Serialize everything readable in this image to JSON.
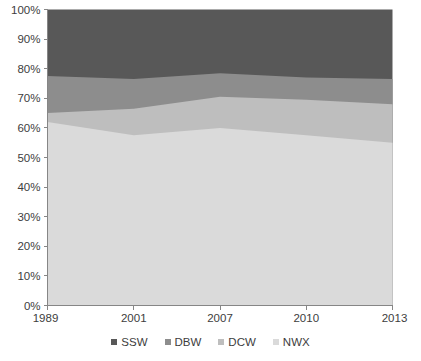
{
  "chart_data": {
    "type": "area",
    "stacked": true,
    "stack_mode": "percent",
    "title": "",
    "subtitle": "",
    "xlabel": "",
    "ylabel": "",
    "x": [
      "1989",
      "2001",
      "2007",
      "2010",
      "2013"
    ],
    "categories": [
      "1989",
      "2001",
      "2007",
      "2010",
      "2013"
    ],
    "xtick_labels": [
      "1989",
      "2001",
      "2007",
      "2010",
      "2013"
    ],
    "ytick_labels": [
      "0%",
      "10%",
      "20%",
      "30%",
      "40%",
      "50%",
      "60%",
      "70%",
      "80%",
      "90%",
      "100%"
    ],
    "ytick_values": [
      0,
      10,
      20,
      30,
      40,
      50,
      60,
      70,
      80,
      90,
      100
    ],
    "ylim": [
      0,
      100
    ],
    "grid": false,
    "legend_position": "bottom",
    "series_order_bottom_to_top": [
      "NWX",
      "DCW",
      "DBW",
      "SSW"
    ],
    "series": [
      {
        "name": "SSW",
        "color": "#585858",
        "values": [
          22.5,
          23.5,
          21.5,
          23.0,
          23.5
        ],
        "cumulative_top": [
          100,
          100,
          100,
          100,
          100
        ]
      },
      {
        "name": "DBW",
        "color": "#8d8d8d",
        "values": [
          12.5,
          10.0,
          8.0,
          7.5,
          8.5
        ],
        "cumulative_top": [
          77.5,
          76.5,
          78.5,
          77.0,
          76.5
        ]
      },
      {
        "name": "DCW",
        "color": "#bebebe",
        "values": [
          3.0,
          9.0,
          10.5,
          12.0,
          13.0
        ],
        "cumulative_top": [
          65.0,
          66.5,
          70.5,
          69.5,
          68.0
        ]
      },
      {
        "name": "NWX",
        "color": "#dadada",
        "values": [
          62.0,
          57.5,
          60.0,
          57.5,
          55.0
        ],
        "cumulative_top": [
          62.0,
          57.5,
          60.0,
          57.5,
          55.0
        ]
      }
    ]
  },
  "legend": {
    "items": [
      {
        "label": "SSW",
        "color": "#585858"
      },
      {
        "label": "DBW",
        "color": "#8d8d8d"
      },
      {
        "label": "DCW",
        "color": "#bebebe"
      },
      {
        "label": "NWX",
        "color": "#dadada"
      }
    ]
  },
  "axis": {
    "y_labels": [
      "100%",
      "90%",
      "80%",
      "70%",
      "60%",
      "50%",
      "40%",
      "30%",
      "20%",
      "10%",
      "0%"
    ],
    "x_labels": [
      "1989",
      "2001",
      "2007",
      "2010",
      "2013"
    ],
    "axis_color": "#868686"
  }
}
